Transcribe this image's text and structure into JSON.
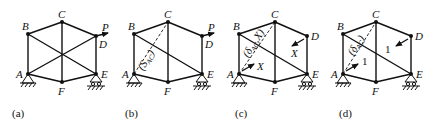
{
  "figure": {
    "type": "truss-diagrams",
    "panels": [
      {
        "id": "a",
        "caption": "(a)",
        "nodes": [
          "A",
          "B",
          "C",
          "D",
          "E",
          "F"
        ],
        "load_label": "P",
        "members": [
          "AB",
          "BC",
          "CD",
          "DE",
          "AF",
          "FE",
          "CF",
          "BE",
          "AD"
        ],
        "supports": {
          "A": "pin",
          "E": "roller"
        }
      },
      {
        "id": "b",
        "caption": "(b)",
        "nodes": [
          "A",
          "B",
          "C",
          "D",
          "E",
          "F"
        ],
        "load_label": "P",
        "members": [
          "AB",
          "BC",
          "CD",
          "DE",
          "AF",
          "FE",
          "CF",
          "BE"
        ],
        "removed_member": "AC",
        "removed_label": "(S_AC)",
        "supports": {
          "A": "pin",
          "E": "roller"
        }
      },
      {
        "id": "c",
        "caption": "(c)",
        "nodes": [
          "A",
          "B",
          "C",
          "D",
          "E",
          "F"
        ],
        "members": [
          "AB",
          "BC",
          "CD",
          "DE",
          "AF",
          "FE",
          "CF",
          "BE"
        ],
        "removed_member": "AC",
        "removed_label": "(δ_AC,X)",
        "forces": [
          {
            "at": "A",
            "label": "X"
          },
          {
            "at": "D",
            "label": "X"
          }
        ],
        "supports": {
          "A": "pin",
          "E": "roller"
        }
      },
      {
        "id": "d",
        "caption": "(d)",
        "nodes": [
          "A",
          "B",
          "C",
          "D",
          "E",
          "F"
        ],
        "members": [
          "AB",
          "BC",
          "CD",
          "DE",
          "AF",
          "FE",
          "CF",
          "BE"
        ],
        "removed_member": "AC",
        "removed_label": "(δ_AC)",
        "forces": [
          {
            "at": "A",
            "label": "1"
          },
          {
            "at": "D",
            "label": "1"
          }
        ],
        "supports": {
          "A": "pin",
          "E": "roller"
        }
      }
    ]
  },
  "labels": {
    "A": "A",
    "B": "B",
    "C": "C",
    "D": "D",
    "E": "E",
    "F": "F",
    "P": "P",
    "a": "(a)",
    "b": "(b)",
    "c": "(c)",
    "d": "(d)",
    "X": "X",
    "one": "1",
    "b_diag": "(S",
    "b_diag_sub": "AC",
    "b_diag_end": ")",
    "c_diag": "(δ",
    "c_diag_sub": "AC",
    "c_diag_end": ",X)",
    "d_diag": "(δ",
    "d_diag_sub": "AC",
    "d_diag_end": ")"
  }
}
